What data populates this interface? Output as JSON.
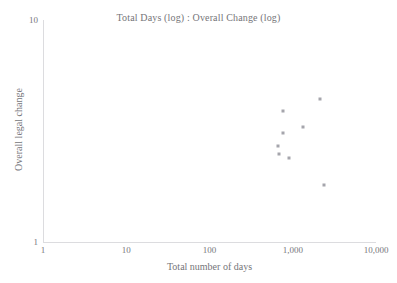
{
  "chart_data": {
    "type": "scatter",
    "title": "Total Days (log) : Overall Change (log)",
    "xlabel": "Total number of days",
    "ylabel": "Overall legal change",
    "xscale": "log",
    "yscale": "log",
    "xlim": [
      1,
      10000
    ],
    "ylim": [
      1,
      10
    ],
    "grid": false,
    "legend": null,
    "xticks": [
      {
        "value": 1,
        "label": "1"
      },
      {
        "value": 10,
        "label": "10"
      },
      {
        "value": 100,
        "label": "100"
      },
      {
        "value": 1000,
        "label": "1,000"
      },
      {
        "value": 10000,
        "label": "10,000"
      }
    ],
    "yticks": [
      {
        "value": 1,
        "label": "1"
      },
      {
        "value": 10,
        "label": "10"
      }
    ],
    "marker": {
      "shape": "square",
      "color": "#a5a5ac",
      "size": 3
    },
    "points": [
      {
        "x": 2150,
        "y": 4.4
      },
      {
        "x": 770,
        "y": 3.9
      },
      {
        "x": 1330,
        "y": 3.3
      },
      {
        "x": 770,
        "y": 3.1
      },
      {
        "x": 660,
        "y": 2.7
      },
      {
        "x": 680,
        "y": 2.5
      },
      {
        "x": 910,
        "y": 2.4
      },
      {
        "x": 2350,
        "y": 1.8
      }
    ]
  },
  "colors": {
    "background": "#ffffff",
    "axis": "#dcdcdf",
    "text": "#75757a",
    "marker": "#a5a5ac"
  }
}
